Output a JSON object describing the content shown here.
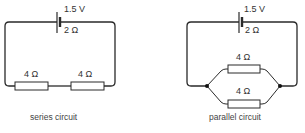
{
  "series": {
    "caption": "series circuit",
    "battery": {
      "voltage": "1.5 V",
      "internal_resistance": "2 Ω"
    },
    "resistors": [
      {
        "label": "4 Ω"
      },
      {
        "label": "4 Ω"
      }
    ]
  },
  "parallel": {
    "caption": "parallel circuit",
    "battery": {
      "voltage": "1.5 V",
      "internal_resistance": "2 Ω"
    },
    "resistors": [
      {
        "label": "4 Ω"
      },
      {
        "label": "4 Ω"
      }
    ]
  }
}
